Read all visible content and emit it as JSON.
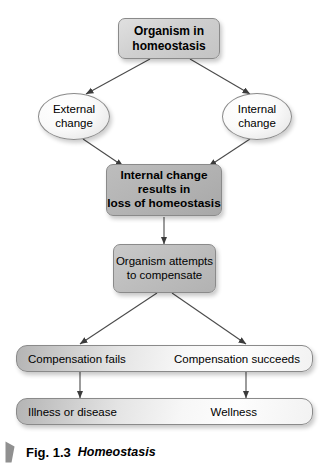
{
  "figure": {
    "caption_number": "Fig. 1.3",
    "caption_title": "Homeostasis",
    "flag_icon": "corner-flag-icon"
  },
  "nodes": {
    "start": {
      "label": "Organism in homeostasis",
      "line1": "Organism in",
      "line2": "homeostasis",
      "shape": "rounded-rect",
      "fill": "#cfcfcf"
    },
    "external_change": {
      "label": "External change",
      "line1": "External",
      "line2": "change",
      "shape": "ellipse",
      "fill": "#fafafa"
    },
    "internal_change": {
      "label": "Internal change",
      "line1": "Internal",
      "line2": "change",
      "shape": "ellipse",
      "fill": "#fafafa"
    },
    "loss": {
      "label": "Internal change results in loss of homeostasis",
      "line1": "Internal change",
      "line2": "results in",
      "line3": "loss of homeostasis",
      "shape": "rounded-rect",
      "fill": "#b3b3b3"
    },
    "compensate": {
      "label": "Organism attempts to compensate",
      "line1": "Organism attempts",
      "line2": "to compensate",
      "shape": "rounded-rect",
      "fill": "#bdbdbd"
    }
  },
  "bars": {
    "outcome_bar": {
      "left_label": "Compensation fails",
      "right_label": "Compensation succeeds"
    },
    "result_bar": {
      "left_label": "Illness or disease",
      "right_label": "Wellness"
    }
  },
  "edges": [
    {
      "name": "start-to-external",
      "from": "start",
      "to": "external_change"
    },
    {
      "name": "start-to-internal",
      "from": "start",
      "to": "internal_change"
    },
    {
      "name": "external-to-loss",
      "from": "external_change",
      "to": "loss"
    },
    {
      "name": "internal-to-loss",
      "from": "internal_change",
      "to": "loss"
    },
    {
      "name": "loss-to-compensate",
      "from": "loss",
      "to": "compensate"
    },
    {
      "name": "compensate-to-fails",
      "from": "compensate",
      "to": "outcome_bar_left"
    },
    {
      "name": "compensate-to-succeeds",
      "from": "compensate",
      "to": "outcome_bar_right"
    },
    {
      "name": "fails-to-illness",
      "from": "outcome_bar_left",
      "to": "result_bar_left"
    },
    {
      "name": "succeeds-to-wellness",
      "from": "outcome_bar_right",
      "to": "result_bar_right"
    }
  ],
  "colors": {
    "background": "#ffffff",
    "stroke": "#555555",
    "border": "#8a8a8a",
    "text": "#000000",
    "flag": "#909090"
  }
}
